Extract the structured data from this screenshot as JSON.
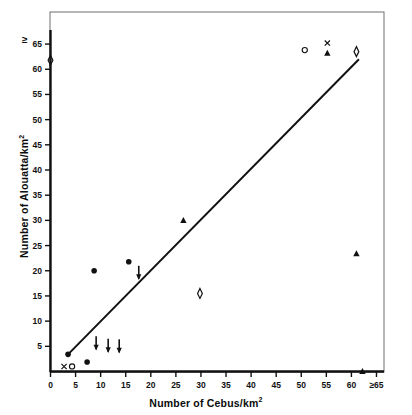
{
  "chart_data": {
    "type": "scatter",
    "title": "",
    "xlabel": "Number of Cebus/km",
    "xlabel_sup": "2",
    "ylabel": "Number of Alouatta/km",
    "ylabel_sup": "2",
    "xlim": [
      0,
      66
    ],
    "ylim": [
      0,
      67
    ],
    "grid": false,
    "legend": "none",
    "xticks": [
      {
        "value": 0,
        "label": "0"
      },
      {
        "value": 5,
        "label": "5"
      },
      {
        "value": 10,
        "label": "10"
      },
      {
        "value": 15,
        "label": "15"
      },
      {
        "value": 20,
        "label": "20"
      },
      {
        "value": 25,
        "label": "25"
      },
      {
        "value": 30,
        "label": "30"
      },
      {
        "value": 35,
        "label": "35"
      },
      {
        "value": 40,
        "label": "40"
      },
      {
        "value": 45,
        "label": "45"
      },
      {
        "value": 50,
        "label": "50"
      },
      {
        "value": 55,
        "label": "55"
      },
      {
        "value": 60,
        "label": "60"
      },
      {
        "value": 65,
        "label": "≥65"
      }
    ],
    "yticks": [
      {
        "value": 5,
        "label": "5"
      },
      {
        "value": 10,
        "label": "10"
      },
      {
        "value": 15,
        "label": "15"
      },
      {
        "value": 20,
        "label": "20"
      },
      {
        "value": 25,
        "label": "25"
      },
      {
        "value": 30,
        "label": "30"
      },
      {
        "value": 35,
        "label": "35"
      },
      {
        "value": 40,
        "label": "40"
      },
      {
        "value": 45,
        "label": "45"
      },
      {
        "value": 50,
        "label": "50"
      },
      {
        "value": 55,
        "label": "55"
      },
      {
        "value": 60,
        "label": "60"
      },
      {
        "value": 65,
        "label": "65"
      }
    ],
    "y_axis_top_annotation": "≥",
    "regression_line": {
      "x1": 3.5,
      "y1": 3.4,
      "x2": 61.5,
      "y2": 62.0
    },
    "series": [
      {
        "name": "filled-circle",
        "marker": "filled-circle",
        "points": [
          {
            "x": 3.5,
            "y": 3.4
          },
          {
            "x": 7.3,
            "y": 1.9
          },
          {
            "x": 8.7,
            "y": 20.0
          },
          {
            "x": 15.6,
            "y": 21.8
          }
        ]
      },
      {
        "name": "down-arrow",
        "marker": "down-arrow",
        "points": [
          {
            "x": 9.1,
            "y": 5.2
          },
          {
            "x": 11.5,
            "y": 4.7
          },
          {
            "x": 13.7,
            "y": 4.6
          },
          {
            "x": 17.6,
            "y": 19.2
          }
        ]
      },
      {
        "name": "filled-triangle",
        "marker": "filled-triangle",
        "points": [
          {
            "x": 26.5,
            "y": 30.0
          },
          {
            "x": 55.2,
            "y": 63.2
          },
          {
            "x": 61.0,
            "y": 23.4
          },
          {
            "x": 62.2,
            "y": 0.0
          }
        ]
      },
      {
        "name": "open-diamond",
        "marker": "open-diamond",
        "points": [
          {
            "x": 29.8,
            "y": 15.5
          },
          {
            "x": 61.0,
            "y": 63.5
          },
          {
            "x": 0.0,
            "y": 61.8
          }
        ]
      },
      {
        "name": "open-circle",
        "marker": "open-circle",
        "points": [
          {
            "x": 4.3,
            "y": 1.0
          },
          {
            "x": 50.7,
            "y": 63.8
          }
        ]
      },
      {
        "name": "cross-x",
        "marker": "cross-x",
        "points": [
          {
            "x": 2.7,
            "y": 1.0
          },
          {
            "x": 55.2,
            "y": 65.2
          }
        ]
      }
    ]
  }
}
